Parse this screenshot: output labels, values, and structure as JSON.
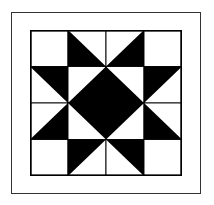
{
  "diagram": {
    "title": "",
    "type": "quilt-block",
    "pattern_name": "eight-pointed star",
    "grid": {
      "rows": 4,
      "cols": 4
    },
    "colors": {
      "dark": "#000000",
      "light": "#ffffff",
      "frame": "#333333",
      "grid_line": "#000000"
    },
    "cells": [
      [
        "light",
        "hst-dark-bottom-left",
        "hst-dark-bottom-right",
        "light"
      ],
      [
        "hst-dark-top-right",
        "hst-dark-bottom-right",
        "hst-dark-bottom-left",
        "hst-dark-top-left"
      ],
      [
        "hst-dark-bottom-right",
        "hst-dark-top-right",
        "hst-dark-top-left",
        "hst-dark-bottom-left"
      ],
      [
        "light",
        "hst-dark-top-left",
        "hst-dark-top-right",
        "light"
      ]
    ]
  }
}
